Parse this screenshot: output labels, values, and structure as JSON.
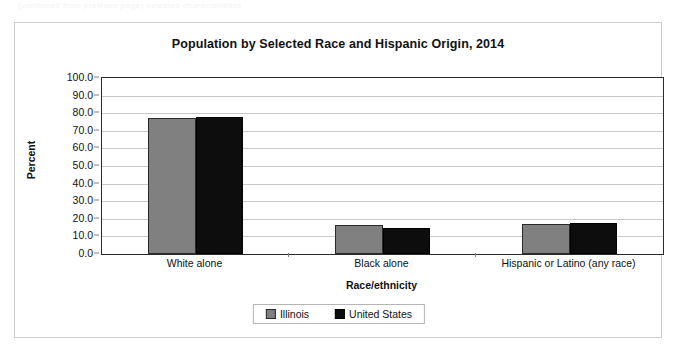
{
  "scan_artifact_text": "(continued from previous page) selected characteristics",
  "chart_frame": {
    "title": "Population by Selected Race and Hispanic Origin, 2014"
  },
  "legend": {
    "items": [
      {
        "label": "Illinois",
        "color": "#808080",
        "swatch_name": "legend-swatch-illinois"
      },
      {
        "label": "United States",
        "color": "#0d0d0d",
        "swatch_name": "legend-swatch-united-states"
      }
    ]
  },
  "chart_data": {
    "type": "bar",
    "title": "Population by Selected Race and Hispanic Origin, 2014",
    "xlabel": "Race/ethnicity",
    "ylabel": "Percent",
    "ylim": [
      0,
      100
    ],
    "ytick_step": 10,
    "ytick_labels": [
      "0.0",
      "10.0",
      "20.0",
      "30.0",
      "40.0",
      "50.0",
      "60.0",
      "70.0",
      "80.0",
      "90.0",
      "100.0"
    ],
    "ytick_values": [
      0,
      10,
      20,
      30,
      40,
      50,
      60,
      70,
      80,
      90,
      100
    ],
    "grid": "horizontal",
    "legend_position": "bottom",
    "categories": [
      "White alone",
      "Black alone",
      "Hispanic or Latino (any race)"
    ],
    "series": [
      {
        "name": "Illinois",
        "color": "#808080",
        "values": [
          77.5,
          16.5,
          17.0
        ]
      },
      {
        "name": "United States",
        "color": "#0d0d0d",
        "values": [
          77.8,
          14.5,
          17.4
        ]
      }
    ]
  }
}
